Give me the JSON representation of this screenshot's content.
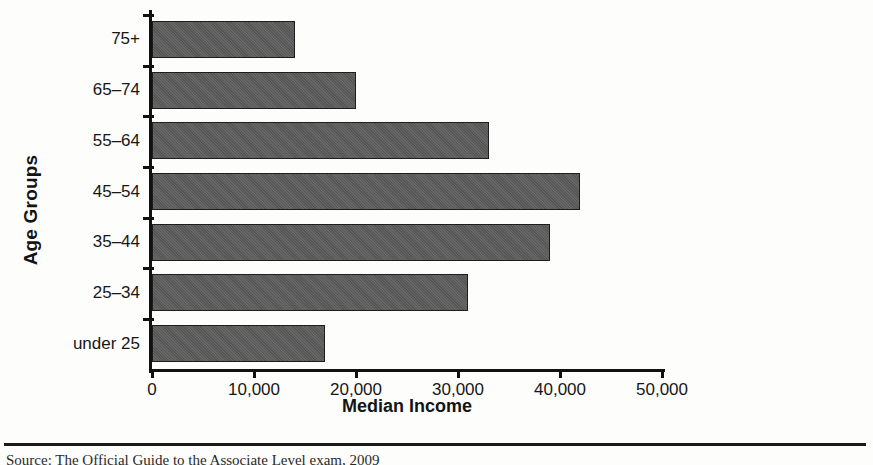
{
  "chart_data": {
    "type": "bar",
    "orientation": "horizontal",
    "title": "",
    "xlabel": "Median Income",
    "ylabel": "Age Groups",
    "categories": [
      "under 25",
      "25–34",
      "35–44",
      "45–54",
      "55–64",
      "65–74",
      "75+"
    ],
    "values": [
      17000,
      31000,
      39000,
      42000,
      33000,
      20000,
      14000
    ],
    "xlim": [
      0,
      50000
    ],
    "xticks": [
      0,
      10000,
      20000,
      30000,
      40000,
      50000
    ],
    "xticklabels": [
      "0",
      "10,000",
      "20,000",
      "30,000",
      "40,000",
      "50,000"
    ],
    "grid": false,
    "legend": null,
    "bar_color": "#565656",
    "bar_edge_color": "#1d1d1d",
    "axis_color": "#111111",
    "background": "#fdfdfb"
  },
  "figure": {
    "caption": "Source: The Official Guide to the Associate Level exam, 2009"
  }
}
